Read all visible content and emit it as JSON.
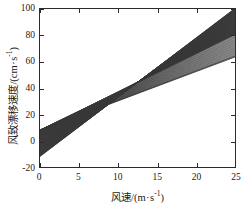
{
  "figure": {
    "background_color": "#ffffff",
    "frame_color": "#2b2b2b",
    "line_color": "#3a3a3a"
  },
  "axes": {
    "x": {
      "label_prefix": "风速/(m",
      "label_mid": "s",
      "label_exp": "-1",
      "label_suffix": ")",
      "label_full": "风速/(m · s-1)",
      "ticks": [
        0,
        5,
        10,
        15,
        20,
        25
      ],
      "tick_labels": [
        "0",
        "5",
        "10",
        "15",
        "20",
        "25"
      ],
      "min": 0,
      "max": 25
    },
    "y": {
      "label_prefix": "风致漂移速度/(cm",
      "label_mid": "s",
      "label_exp": "-1",
      "label_suffix": ")",
      "label_full": "风致漂移速度/(cm · s-1)",
      "ticks": [
        -20,
        0,
        20,
        40,
        60,
        80,
        100
      ],
      "tick_labels": [
        "-20",
        "0",
        "20",
        "40",
        "60",
        "80",
        "100"
      ],
      "min": -20,
      "max": 100
    }
  },
  "chart_data": {
    "type": "line",
    "title": "",
    "xlabel": "风速/(m · s-1)",
    "ylabel": "风致漂移速度/(cm · s-1)",
    "xlim": [
      0,
      25
    ],
    "ylim": [
      -20,
      100
    ],
    "xticks": [
      0,
      5,
      10,
      15,
      20,
      25
    ],
    "yticks": [
      -20,
      0,
      20,
      40,
      60,
      80,
      100
    ],
    "grid": false,
    "legend": null,
    "x": [
      0,
      25
    ],
    "series": [
      {
        "name": "line-01",
        "intercept": -12.0,
        "slope": 4.5,
        "values": [
          -12.0,
          100.5
        ]
      },
      {
        "name": "line-02",
        "intercept": -11.5,
        "slope": 4.46,
        "values": [
          -11.5,
          100.0
        ]
      },
      {
        "name": "line-03",
        "intercept": -11.0,
        "slope": 4.42,
        "values": [
          -11.0,
          99.5
        ]
      },
      {
        "name": "line-04",
        "intercept": -10.5,
        "slope": 4.38,
        "values": [
          -10.5,
          99.0
        ]
      },
      {
        "name": "line-05",
        "intercept": -10.0,
        "slope": 4.34,
        "values": [
          -10.0,
          98.5
        ]
      },
      {
        "name": "line-06",
        "intercept": -9.5,
        "slope": 4.3,
        "values": [
          -9.5,
          98.0
        ]
      },
      {
        "name": "line-07",
        "intercept": -9.0,
        "slope": 4.26,
        "values": [
          -9.0,
          97.5
        ]
      },
      {
        "name": "line-08",
        "intercept": -8.5,
        "slope": 4.22,
        "values": [
          -8.5,
          97.0
        ]
      },
      {
        "name": "line-09",
        "intercept": -8.0,
        "slope": 4.18,
        "values": [
          -8.0,
          96.5
        ]
      },
      {
        "name": "line-10",
        "intercept": -7.5,
        "slope": 4.14,
        "values": [
          -7.5,
          96.0
        ]
      },
      {
        "name": "line-11",
        "intercept": -7.0,
        "slope": 4.1,
        "values": [
          -7.0,
          95.5
        ]
      },
      {
        "name": "line-12",
        "intercept": -6.5,
        "slope": 4.06,
        "values": [
          -6.5,
          95.0
        ]
      },
      {
        "name": "line-13",
        "intercept": -6.0,
        "slope": 4.02,
        "values": [
          -6.0,
          94.5
        ]
      },
      {
        "name": "line-14",
        "intercept": -5.5,
        "slope": 3.98,
        "values": [
          -5.5,
          94.0
        ]
      },
      {
        "name": "line-15",
        "intercept": -5.0,
        "slope": 3.94,
        "values": [
          -5.0,
          93.5
        ]
      },
      {
        "name": "line-16",
        "intercept": -4.5,
        "slope": 3.9,
        "values": [
          -4.5,
          93.0
        ]
      },
      {
        "name": "line-17",
        "intercept": -4.0,
        "slope": 3.86,
        "values": [
          -4.0,
          92.5
        ]
      },
      {
        "name": "line-18",
        "intercept": -3.5,
        "slope": 3.82,
        "values": [
          -3.5,
          92.0
        ]
      },
      {
        "name": "line-19",
        "intercept": -3.0,
        "slope": 3.78,
        "values": [
          -3.0,
          91.5
        ]
      },
      {
        "name": "line-20",
        "intercept": -2.5,
        "slope": 3.74,
        "values": [
          -2.5,
          91.0
        ]
      },
      {
        "name": "line-21",
        "intercept": -2.0,
        "slope": 3.7,
        "values": [
          -2.0,
          90.5
        ]
      },
      {
        "name": "line-22",
        "intercept": -1.5,
        "slope": 3.66,
        "values": [
          -1.5,
          90.0
        ]
      },
      {
        "name": "line-23",
        "intercept": -1.0,
        "slope": 3.62,
        "values": [
          -1.0,
          89.5
        ]
      },
      {
        "name": "line-24",
        "intercept": -0.5,
        "slope": 3.58,
        "values": [
          -0.5,
          89.0
        ]
      },
      {
        "name": "line-25",
        "intercept": 0.0,
        "slope": 3.54,
        "values": [
          0.0,
          88.5
        ]
      },
      {
        "name": "line-26",
        "intercept": 0.5,
        "slope": 3.5,
        "values": [
          0.5,
          88.0
        ]
      },
      {
        "name": "line-27",
        "intercept": 1.0,
        "slope": 3.46,
        "values": [
          1.0,
          87.5
        ]
      },
      {
        "name": "line-28",
        "intercept": 1.5,
        "slope": 3.42,
        "values": [
          1.5,
          87.0
        ]
      },
      {
        "name": "line-29",
        "intercept": 2.0,
        "slope": 3.38,
        "values": [
          2.0,
          86.5
        ]
      },
      {
        "name": "line-30",
        "intercept": 2.5,
        "slope": 3.34,
        "values": [
          2.5,
          86.0
        ]
      },
      {
        "name": "line-31",
        "intercept": 3.0,
        "slope": 3.3,
        "values": [
          3.0,
          85.5
        ]
      },
      {
        "name": "line-32",
        "intercept": 3.5,
        "slope": 3.26,
        "values": [
          3.5,
          85.0
        ]
      },
      {
        "name": "line-33",
        "intercept": 4.0,
        "slope": 3.22,
        "values": [
          4.0,
          84.5
        ]
      },
      {
        "name": "line-34",
        "intercept": 4.5,
        "slope": 3.18,
        "values": [
          4.5,
          84.0
        ]
      },
      {
        "name": "line-35",
        "intercept": 5.0,
        "slope": 3.14,
        "values": [
          5.0,
          83.5
        ]
      },
      {
        "name": "line-36",
        "intercept": 5.5,
        "slope": 3.1,
        "values": [
          5.5,
          83.0
        ]
      },
      {
        "name": "line-37",
        "intercept": 6.0,
        "slope": 3.06,
        "values": [
          6.0,
          82.5
        ]
      },
      {
        "name": "line-38",
        "intercept": 6.5,
        "slope": 3.02,
        "values": [
          6.5,
          82.0
        ]
      },
      {
        "name": "line-39",
        "intercept": 7.0,
        "slope": 2.98,
        "values": [
          7.0,
          81.5
        ]
      },
      {
        "name": "line-40",
        "intercept": 7.5,
        "slope": 2.94,
        "values": [
          7.5,
          81.0
        ]
      },
      {
        "name": "line-41",
        "intercept": 8.0,
        "slope": 2.9,
        "values": [
          8.0,
          80.5
        ]
      },
      {
        "name": "line-42",
        "intercept": 8.0,
        "slope": 2.82,
        "values": [
          8.0,
          78.5
        ]
      },
      {
        "name": "line-43",
        "intercept": 8.0,
        "slope": 2.74,
        "values": [
          8.0,
          76.5
        ]
      },
      {
        "name": "line-44",
        "intercept": 8.0,
        "slope": 2.66,
        "values": [
          8.0,
          74.5
        ]
      },
      {
        "name": "line-45",
        "intercept": 8.0,
        "slope": 2.58,
        "values": [
          8.0,
          72.5
        ]
      },
      {
        "name": "line-46",
        "intercept": 8.0,
        "slope": 2.5,
        "values": [
          8.0,
          70.5
        ]
      },
      {
        "name": "line-47",
        "intercept": 8.0,
        "slope": 2.42,
        "values": [
          8.0,
          68.5
        ]
      },
      {
        "name": "line-48",
        "intercept": 8.0,
        "slope": 2.34,
        "values": [
          8.0,
          66.5
        ]
      },
      {
        "name": "line-49",
        "intercept": 8.0,
        "slope": 2.26,
        "values": [
          8.0,
          64.5
        ]
      },
      {
        "name": "line-50",
        "intercept": 8.0,
        "slope": 2.22,
        "values": [
          8.0,
          63.5
        ]
      }
    ]
  }
}
